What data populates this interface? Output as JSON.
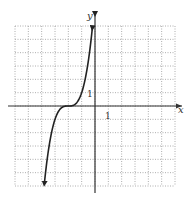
{
  "chart_data": {
    "type": "line",
    "title": "",
    "xlabel": "x",
    "ylabel": "y",
    "xlim": [
      -6,
      6
    ],
    "ylim": [
      -6,
      6
    ],
    "grid": true,
    "grid_style": "dotted",
    "tick_labels": {
      "x": [
        "1"
      ],
      "y": [
        "1"
      ]
    },
    "series": [
      {
        "name": "y = (x + 2)^3",
        "function": "(x+2)^3",
        "x": [
          -3.8,
          -3.5,
          -3,
          -2.5,
          -2,
          -1.5,
          -1,
          -0.5,
          -0.2
        ],
        "values": [
          -5.83,
          -3.38,
          -1,
          -0.13,
          0,
          0.13,
          1,
          3.38,
          5.83
        ],
        "arrows": "both"
      }
    ],
    "legend": null
  },
  "axes": {
    "x_label": "x",
    "y_label": "y",
    "x_tick": "1",
    "y_tick": "1"
  },
  "colors": {
    "curve": "#222222",
    "axis": "#333333",
    "grid": "#999999",
    "background": "#ffffff"
  }
}
